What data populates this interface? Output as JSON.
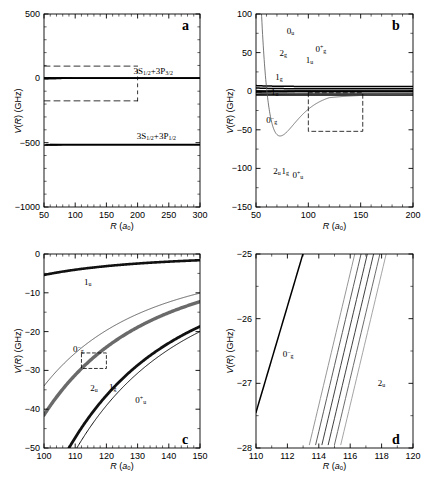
{
  "figure": {
    "caption_panels": [
      "a",
      "b",
      "c",
      "d"
    ],
    "width_px": 425,
    "height_px": 481,
    "line_color": "#000000",
    "bg_color": "#ffffff"
  },
  "panels": {
    "a": {
      "id": "a",
      "xlabel_main": "R",
      "xlabel_unit": "(a",
      "xlabel_unit_sub": "0",
      "xlabel_unit_end": ")",
      "ylabel_main": "V(R)",
      "ylabel_unit": "(GHz)",
      "xticks": [
        "50",
        "100",
        "150",
        "200",
        "250",
        "300"
      ],
      "yticks": [
        "500",
        "0",
        "-500",
        "-1000"
      ],
      "xlim": [
        50,
        300
      ],
      "ylim": [
        -1000,
        500
      ],
      "annotations": [
        {
          "name": "asymptote-upper",
          "text": "3S1/2+3P3/2",
          "x": 200,
          "y": 60
        },
        {
          "name": "asymptote-lower",
          "text": "3S1/2+3P1/2",
          "x": 205,
          "y": -450
        }
      ],
      "inset_box": {
        "x0": 50,
        "x1": 200,
        "y0": -175,
        "y1": 95
      }
    },
    "b": {
      "id": "b",
      "xlabel_main": "R",
      "ylabel_main": "V(R)",
      "ylabel_unit": "(GHz)",
      "xticks": [
        "50",
        "100",
        "150",
        "200"
      ],
      "yticks": [
        "100",
        "50",
        "0",
        "-50",
        "-100",
        "-150"
      ],
      "xlim": [
        50,
        200
      ],
      "ylim": [
        -150,
        100
      ],
      "curve_labels": [
        {
          "name": "curve-label-0u",
          "base": "0",
          "sub": "u",
          "sup": "",
          "x": 83,
          "y": 78
        },
        {
          "name": "curve-label-2g",
          "base": "2",
          "sub": "g",
          "sup": "",
          "x": 76,
          "y": 49
        },
        {
          "name": "curve-label-0gplus",
          "base": "0",
          "sub": "g",
          "sup": "+",
          "x": 112,
          "y": 55
        },
        {
          "name": "curve-label-1u-upper",
          "base": "1",
          "sub": "u",
          "sup": "",
          "x": 101,
          "y": 41
        },
        {
          "name": "curve-label-1g",
          "base": "1",
          "sub": "g",
          "sup": "",
          "x": 72,
          "y": 19
        },
        {
          "name": "curve-label-1u-lower",
          "base": "1",
          "sub": "u",
          "sup": "",
          "x": 68,
          "y": -1
        },
        {
          "name": "curve-label-0gminus",
          "base": "0",
          "sub": "g",
          "sup": "-",
          "x": 65,
          "y": -37
        },
        {
          "name": "curve-label-2u",
          "base": "2",
          "sub": "u",
          "sup": "",
          "x": 70,
          "y": -103
        },
        {
          "name": "curve-label-1g-lower",
          "base": "1",
          "sub": "g",
          "sup": "",
          "x": 78,
          "y": -103
        },
        {
          "name": "curve-label-0uplus",
          "base": "0",
          "sub": "u",
          "sup": "+",
          "x": 90,
          "y": -108
        }
      ],
      "inset_box": {
        "x0": 100,
        "x1": 152,
        "y0": -52,
        "y1": -2
      }
    },
    "c": {
      "id": "c",
      "xlabel_main": "R",
      "ylabel_main": "V(R)",
      "ylabel_unit": "(GHz)",
      "xticks": [
        "100",
        "110",
        "120",
        "130",
        "140",
        "150"
      ],
      "yticks": [
        "0",
        "-10",
        "-20",
        "-30",
        "-40",
        "-50"
      ],
      "xlim": [
        100,
        150
      ],
      "ylim": [
        -50,
        0
      ],
      "curve_labels": [
        {
          "name": "curve-label-1u",
          "base": "1",
          "sub": "u",
          "sup": "",
          "x": 114,
          "y": -7.2
        },
        {
          "name": "curve-label-0gminus",
          "base": "0",
          "sub": "g",
          "sup": "-",
          "x": 111,
          "y": -24.5
        },
        {
          "name": "curve-label-2u",
          "base": "2",
          "sub": "u",
          "sup": "",
          "x": 116,
          "y": -34.5
        },
        {
          "name": "curve-label-1g",
          "base": "1",
          "sub": "g",
          "sup": "",
          "x": 122,
          "y": -34.2
        },
        {
          "name": "curve-label-0uplus",
          "base": "0",
          "sub": "u",
          "sup": "+",
          "x": 131,
          "y": -37.5
        }
      ],
      "inset_box": {
        "x0": 112,
        "x1": 120,
        "y0": -29.5,
        "y1": -25.5
      }
    },
    "d": {
      "id": "d",
      "xlabel_main": "R",
      "ylabel_main": "V(R)",
      "ylabel_unit": "(GHz)",
      "xticks": [
        "110",
        "112",
        "114",
        "116",
        "118",
        "120"
      ],
      "yticks": [
        "-25",
        "-26",
        "-27",
        "-28"
      ],
      "xlim": [
        110,
        120
      ],
      "ylim": [
        -28,
        -25
      ],
      "curve_labels": [
        {
          "name": "curve-label-0gminus",
          "base": "0",
          "sub": "g",
          "sup": "-",
          "x": 112.05,
          "y": -26.55
        },
        {
          "name": "curve-label-2u",
          "base": "2",
          "sub": "u",
          "sup": "",
          "x": 118.0,
          "y": -27.0
        }
      ]
    }
  },
  "chart_data": {
    "type": "line",
    "xlabel": "R (a0)",
    "ylabel": "V(R) (GHz)",
    "grid": false,
    "legend": "inline curve labels",
    "panels": [
      {
        "id": "a",
        "xlim": [
          50,
          300
        ],
        "ylim": [
          -1000,
          500
        ],
        "xticks": [
          50,
          100,
          150,
          200,
          250,
          300
        ],
        "yticks": [
          500,
          0,
          -500,
          -1000
        ],
        "asymptotes": [
          {
            "label": "3S1/2+3P3/2",
            "value": 0
          },
          {
            "label": "3S1/2+3P1/2",
            "value": -515
          }
        ],
        "series": [
          {
            "name": "upper-manifold-rep-1",
            "asymptote": 0,
            "C3": 600000,
            "sign": 1,
            "Rin": 50
          },
          {
            "name": "upper-manifold-rep-2",
            "asymptote": 0,
            "C3": 420000,
            "sign": 1,
            "Rin": 52
          },
          {
            "name": "upper-manifold-rep-3",
            "asymptote": 0,
            "C3": 300000,
            "sign": 1,
            "Rin": 53
          },
          {
            "name": "upper-manifold-rep-4",
            "asymptote": 0,
            "C3": 200000,
            "sign": 1,
            "Rin": 55
          },
          {
            "name": "upper-manifold-rep-5",
            "asymptote": 0,
            "C3": 120000,
            "sign": 1,
            "Rin": 57
          },
          {
            "name": "upper-manifold-att-1",
            "asymptote": 0,
            "C3": 600000,
            "sign": -1,
            "Rin": 50
          },
          {
            "name": "upper-manifold-att-2",
            "asymptote": 0,
            "C3": 430000,
            "sign": -1,
            "Rin": 52
          },
          {
            "name": "upper-manifold-att-3",
            "asymptote": 0,
            "C3": 300000,
            "sign": -1,
            "Rin": 54
          },
          {
            "name": "upper-manifold-att-4",
            "asymptote": 0,
            "C3": 180000,
            "sign": -1,
            "Rin": 56
          },
          {
            "name": "lower-manifold-rep-1",
            "asymptote": -515,
            "C3": 380000,
            "sign": 1,
            "Rin": 54
          },
          {
            "name": "lower-manifold-rep-2",
            "asymptote": -515,
            "C3": 210000,
            "sign": 1,
            "Rin": 58
          },
          {
            "name": "lower-manifold-att-1",
            "asymptote": -515,
            "C3": 560000,
            "sign": -1,
            "Rin": 50
          },
          {
            "name": "lower-manifold-att-2",
            "asymptote": -515,
            "C3": 430000,
            "sign": -1,
            "Rin": 52
          },
          {
            "name": "lower-manifold-att-3",
            "asymptote": -515,
            "C3": 330000,
            "sign": -1,
            "Rin": 54
          },
          {
            "name": "lower-manifold-att-4",
            "asymptote": -515,
            "C3": 240000,
            "sign": -1,
            "Rin": 56
          },
          {
            "name": "lower-manifold-att-5",
            "asymptote": -515,
            "C3": 160000,
            "sign": -1,
            "Rin": 59
          }
        ]
      },
      {
        "id": "b",
        "xlim": [
          50,
          200
        ],
        "ylim": [
          -150,
          100
        ],
        "xticks": [
          50,
          100,
          150,
          200
        ],
        "yticks": [
          100,
          50,
          0,
          -50,
          -100,
          -150
        ],
        "series": [
          {
            "name": "0u",
            "C3": 140000,
            "sign": 1,
            "offset": 0,
            "width": 1.0
          },
          {
            "name": "2g",
            "C3": 95000,
            "sign": 1,
            "offset": 0,
            "width": 1.0
          },
          {
            "name": "0g+",
            "C3": 160000,
            "sign": 1,
            "offset": 6,
            "width": 1.6
          },
          {
            "name": "1u-upper",
            "C3": 150000,
            "sign": 1,
            "offset": 3,
            "width": 1.6
          },
          {
            "name": "1g",
            "C3": 48000,
            "sign": 1,
            "offset": 0,
            "width": 1.0
          },
          {
            "name": "1u-lower",
            "C3": 17000,
            "sign": 1,
            "offset": -5,
            "width": 1.6
          },
          {
            "name": "0g-",
            "C3": 60000,
            "sign": -1,
            "offset": 0,
            "width": 0.9,
            "well_depth": -58,
            "well_R": 73
          },
          {
            "name": "2u",
            "C3": 115000,
            "sign": -1,
            "offset": 0,
            "width": 1.6
          },
          {
            "name": "1g-lower",
            "C3": 150000,
            "sign": -1,
            "offset": 0,
            "width": 1.6
          },
          {
            "name": "0u+",
            "C3": 165000,
            "sign": -1,
            "offset": -2,
            "width": 1.0
          }
        ]
      },
      {
        "id": "c",
        "xlim": [
          100,
          150
        ],
        "ylim": [
          -50,
          0
        ],
        "xticks": [
          100,
          110,
          120,
          130,
          140,
          150
        ],
        "yticks": [
          0,
          -10,
          -20,
          -30,
          -40,
          -50
        ],
        "series": [
          {
            "name": "1u",
            "C3": 5400000,
            "sign": -1,
            "width": 2.6,
            "color": "#111111"
          },
          {
            "name": "0g-",
            "C3": 34000000,
            "sign": -1,
            "width": 0.9,
            "color": "#555555"
          },
          {
            "name": "2u",
            "C3": 41500000,
            "sign": -1,
            "width": 3.4,
            "color": "#6a6a6a"
          },
          {
            "name": "1g",
            "C3": 63000000,
            "sign": -1,
            "width": 2.8,
            "color": "#111111"
          },
          {
            "name": "0u+",
            "C3": 67500000,
            "sign": -1,
            "width": 1.0,
            "color": "#111111"
          }
        ]
      },
      {
        "id": "d",
        "xlim": [
          110,
          120
        ],
        "ylim": [
          -28,
          -25
        ],
        "xticks": [
          110,
          112,
          114,
          116,
          118,
          120
        ],
        "yticks": [
          -25,
          -26,
          -27,
          -28
        ],
        "series": [
          {
            "name": "0g-",
            "x0": 110,
            "y0": -27.45,
            "slope": 0.82,
            "width": 1.5,
            "color": "#000000"
          },
          {
            "name": "2u-1",
            "x0": 113.35,
            "y0": -28.0,
            "slope": 1.02,
            "width": 0.9,
            "color": "#8a8a8a"
          },
          {
            "name": "2u-2",
            "x0": 113.75,
            "y0": -28.0,
            "slope": 1.02,
            "width": 0.9,
            "color": "#4a4a4a"
          },
          {
            "name": "2u-3",
            "x0": 114.15,
            "y0": -28.0,
            "slope": 1.02,
            "width": 0.9,
            "color": "#2a2a2a"
          },
          {
            "name": "2u-4",
            "x0": 114.55,
            "y0": -28.0,
            "slope": 1.02,
            "width": 0.9,
            "color": "#2a2a2a"
          },
          {
            "name": "2u-5",
            "x0": 114.95,
            "y0": -28.0,
            "slope": 1.02,
            "width": 0.9,
            "color": "#5a5a5a"
          },
          {
            "name": "2u-6",
            "x0": 115.35,
            "y0": -28.0,
            "slope": 1.02,
            "width": 0.9,
            "color": "#9a9a9a"
          }
        ]
      }
    ]
  }
}
